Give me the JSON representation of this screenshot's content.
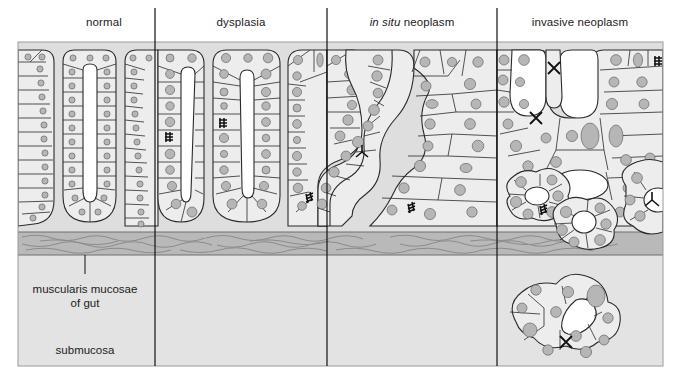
{
  "figure": {
    "title_labels": [
      {
        "id": "normal",
        "text": "normal",
        "x": 104,
        "y": 22
      },
      {
        "id": "dysplasia",
        "text": "dysplasia",
        "x": 241,
        "y": 22
      },
      {
        "id": "in-situ-neoplasm",
        "text_italic": "in situ",
        "text": " neoplasm",
        "x": 412,
        "y": 22
      },
      {
        "id": "invasive-neoplasm",
        "text": "invasive neoplasm",
        "x": 580,
        "y": 22
      }
    ],
    "annotations": [
      {
        "id": "muscularis-mucosae",
        "line1": "muscularis mucosae",
        "line2": "of gut",
        "x": 85,
        "y": 283
      },
      {
        "id": "submucosa",
        "line1": "submucosa",
        "x": 85,
        "y": 344
      }
    ],
    "panel": {
      "x": 18,
      "y": 42,
      "width": 645,
      "height": 324
    },
    "dividers_x": [
      155,
      327,
      497
    ],
    "muscularis_band": {
      "y": 232,
      "height": 23
    },
    "colors": {
      "page_background": "#ffffff",
      "mucosa_background": "#dedede",
      "submucosa_background": "#e3e3e3",
      "muscularis_band": "#b9b9b9",
      "cell_fill": "#ededed",
      "nucleus_fill": "#b6b6b6",
      "lumen_fill": "#ffffff",
      "outline": "#2a2a2a",
      "divider": "#111111",
      "text": "#1b1b1b"
    },
    "legend_semantics": {
      "mitotic_figure_normal": "small dark mitotic figure scribble",
      "mitotic_figure_abnormal": "X-shaped abnormal mitosis",
      "tripolar_mitosis": "Y-shaped tripolar mitosis"
    }
  }
}
